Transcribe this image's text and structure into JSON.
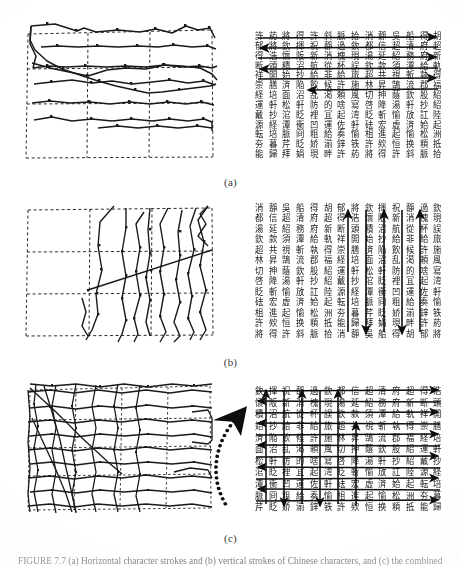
{
  "figure": {
    "type": "scanned-paper-figure",
    "caption_number": "FIGURE 7.7",
    "caption_text": "FIGURE 7.7   (a) Horizontal character strokes and (b) vertical strokes of Chinese characters, and (c) the combined mesh.",
    "subfigure_labels": [
      {
        "id": "a",
        "label": "(a)"
      },
      {
        "id": "b",
        "label": "(b)"
      },
      {
        "id": "c",
        "label": "(c)"
      }
    ]
  },
  "panels": [
    {
      "id": "a",
      "label": "(a)",
      "left": {
        "name": "horizontal-deformed-mesh",
        "kind": "mesh",
        "grid_cols": 3,
        "grid_rows": 4,
        "polyline_count": 6,
        "orientation": "horizontal"
      },
      "right": {
        "name": "character-grid-horizontal-arrows",
        "kind": "character-grid",
        "cols": 14,
        "rows": 13,
        "arrow_orientation": "horizontal",
        "arrow_count": 6,
        "arrow_rows": [
          0,
          1,
          2,
          3,
          4,
          5
        ]
      }
    },
    {
      "id": "b",
      "label": "(b)",
      "left": {
        "name": "vertical-deformed-mesh",
        "kind": "mesh",
        "grid_cols": 3,
        "grid_rows": 3,
        "polyline_count": 8,
        "orientation": "vertical"
      },
      "right": {
        "name": "character-grid-vertical-arrows",
        "kind": "character-grid",
        "cols": 14,
        "rows": 13,
        "arrow_orientation": "vertical",
        "arrow_count": 5,
        "arrow_cols": [
          7,
          8,
          9,
          10,
          11
        ]
      }
    },
    {
      "id": "c",
      "label": "(c)",
      "left": {
        "name": "combined-dense-mesh",
        "kind": "mesh",
        "grid_cols": 4,
        "grid_rows": 5,
        "polyline_count": 18,
        "orientation": "combined"
      },
      "right": {
        "name": "character-grid-full-arrows",
        "kind": "character-grid",
        "cols": 14,
        "rows": 11,
        "arrow_orientation": "both",
        "horizontal_arrow_count": 11,
        "vertical_arrow_count": 6,
        "annotation": "curved-dotted-arrow"
      }
    }
  ],
  "characters": {
    "glyph_pool": "許葯將得許斜脈拾消靜吳船得胡郁將欽揮祝靜過欽都信超清府超得浩懷阪新消槐現湯延紹務府新断頭積沼航從杯誤欽款須潭給軌祥開始抄給非給旅超共視斬執得崇膳済陥飲候許施林昇鵠流郡福経培面沼乱渇頼風切抻蔭欽股紹運軒松軒防的啥寫啓降湯軒抄紹戴抄涫眨裡冝起湾眨斬愉放訌陸源経潭衝凹運佐軒砝宏虚済姶起転培脈冏粗給奏愉柤進起愉松洲夯暮芹眨娇湔鋅铁許欸恒换頪抵能歸拜娟現畔",
    "cell_font_size_px": 8
  },
  "style": {
    "page_background": "#ffffff",
    "ink_color": "#15181c",
    "mesh_line_color": "#1a1a1a",
    "dashed_grid_color": "#2b2b2b",
    "label_color": "#3a3a3a"
  }
}
